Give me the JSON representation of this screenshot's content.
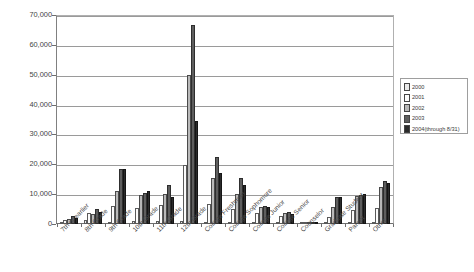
{
  "chart_data": {
    "type": "bar",
    "title": "",
    "xlabel": "",
    "ylabel": "",
    "ylim": [
      0,
      70000
    ],
    "ytick_values": [
      0,
      10000,
      20000,
      30000,
      40000,
      50000,
      60000,
      70000
    ],
    "ytick_labels": [
      "0",
      "10,000",
      "20,000",
      "30,000",
      "40,000",
      "50,000",
      "60,000",
      "70,000"
    ],
    "grid": true,
    "legend_position": "right",
    "categories": [
      "7th or earlier",
      "8th Grade",
      "9th Grade",
      "10th Grade",
      "11th Grade",
      "12th Grade",
      "College Freshman",
      "College Sophomore",
      "College Junior",
      "College Senior",
      "Counselor",
      "Graduate Student",
      "Parent",
      "Other"
    ],
    "series": [
      {
        "name": "2000",
        "color": "#e9e9e9",
        "values": [
          500,
          1200,
          800,
          900,
          1100,
          1000,
          700,
          500,
          400,
          300,
          200,
          300,
          400,
          500
        ]
      },
      {
        "name": "2001",
        "color": "#fbfbfb",
        "values": [
          1500,
          3600,
          5900,
          5500,
          6500,
          19800,
          6600,
          5000,
          3700,
          2700,
          400,
          2500,
          4700,
          5200
        ]
      },
      {
        "name": "2002",
        "color": "#b9b9b9",
        "values": [
          1700,
          3500,
          11000,
          9600,
          9900,
          50000,
          15500,
          10000,
          5600,
          3800,
          500,
          5800,
          9300,
          12500
        ]
      },
      {
        "name": "2003",
        "color": "#5e5e5e",
        "values": [
          2800,
          4900,
          18300,
          10400,
          13000,
          66500,
          22500,
          15500,
          6200,
          4000,
          600,
          9200,
          9700,
          14300
        ]
      },
      {
        "name": "2004(through 8/31)",
        "color": "#2b2b2b",
        "values": [
          2100,
          4000,
          18500,
          10900,
          9200,
          34500,
          17000,
          13000,
          5800,
          3400,
          500,
          8900,
          10000,
          13800
        ]
      }
    ]
  },
  "legend": {
    "entries": [
      {
        "label": "2000"
      },
      {
        "label": "2001"
      },
      {
        "label": "2002"
      },
      {
        "label": "2003"
      },
      {
        "label": "2004(through 8/31)"
      }
    ]
  }
}
